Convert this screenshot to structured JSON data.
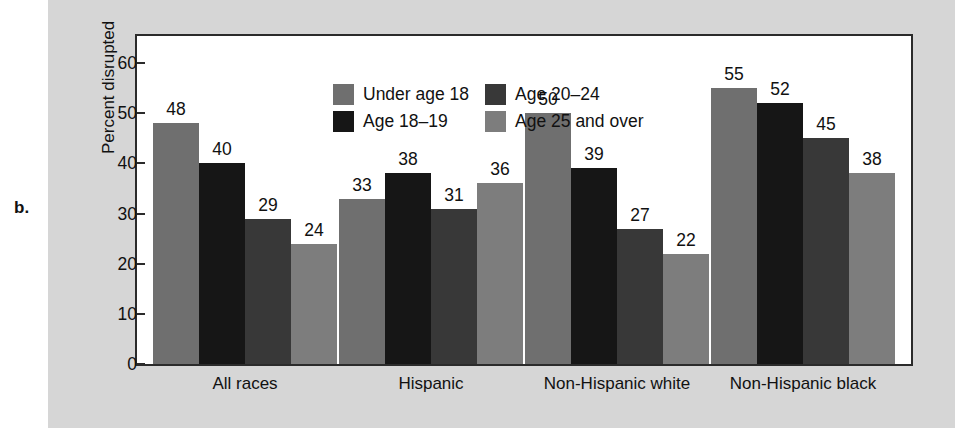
{
  "figure": {
    "part_label": "b."
  },
  "chart_data": {
    "type": "bar",
    "title": "",
    "subtitle": "",
    "xlabel": "",
    "ylabel": "Percent disrupted",
    "ylim": [
      0,
      65
    ],
    "yticks": [
      0,
      10,
      20,
      30,
      40,
      50,
      60
    ],
    "ytick_labels": [
      "0",
      "10",
      "20",
      "30",
      "40",
      "50",
      "60"
    ],
    "grid": false,
    "legend_position": "top-left-inside",
    "categories": [
      "All races",
      "Hispanic",
      "Non-Hispanic white",
      "Non-Hispanic black"
    ],
    "series": [
      {
        "name": "Under age 18",
        "color": "#6f6f6f",
        "values": [
          48,
          33,
          50,
          55
        ]
      },
      {
        "name": "Age 18–19",
        "color": "#161616",
        "values": [
          40,
          38,
          39,
          52
        ]
      },
      {
        "name": "Age 20–24",
        "color": "#383838",
        "values": [
          29,
          31,
          27,
          45
        ]
      },
      {
        "name": "Age 25 and over",
        "color": "#7d7d7d",
        "values": [
          24,
          36,
          22,
          38
        ]
      }
    ],
    "data_labels": [
      [
        48,
        40,
        29,
        24
      ],
      [
        33,
        38,
        31,
        36
      ],
      [
        50,
        39,
        27,
        22
      ],
      [
        55,
        52,
        45,
        38
      ]
    ],
    "colors": {
      "panel_background": "#d6d6d6",
      "plot_background": "#ffffff",
      "axis": "#2b2b2b",
      "text": "#111111"
    }
  }
}
